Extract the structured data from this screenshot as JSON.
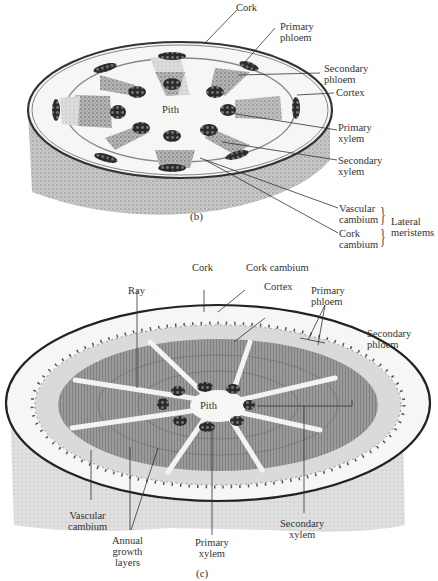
{
  "panel_b": {
    "label": "(b)",
    "labels": {
      "cork": "Cork",
      "primary_phloem": [
        "Primary",
        "phloem"
      ],
      "secondary_phloem": [
        "Secondary",
        "phloem"
      ],
      "cortex": "Cortex",
      "pith": "Pith",
      "primary_xylem": [
        "Primary",
        "xylem"
      ],
      "secondary_xylem": [
        "Secondary",
        "xylem"
      ],
      "vascular_cambium": [
        "Vascular",
        "cambium"
      ],
      "cork_cambium": [
        "Cork",
        "cambium"
      ],
      "lateral_meristems": [
        "Lateral",
        "meristems"
      ]
    }
  },
  "panel_c": {
    "label": "(c)",
    "labels": {
      "cork": "Cork",
      "cork_cambium": "Cork cambium",
      "cortex": "Cortex",
      "ray": "Ray",
      "primary_phloem": [
        "Primary",
        "phloem"
      ],
      "secondary_phloem": [
        "Secondary",
        "phloem"
      ],
      "pith": "Pith",
      "vascular_cambium": [
        "Vascular",
        "cambium"
      ],
      "annual_growth_layers": [
        "Annual",
        "growth",
        "layers"
      ],
      "primary_xylem": [
        "Primary",
        "xylem"
      ],
      "secondary_xylem": [
        "Secondary",
        "xylem"
      ]
    }
  },
  "colors": {
    "bark": "#9a9a9a",
    "cortex": "#f4f4f2",
    "phloem": "#d6d6d6",
    "xylem": "#8e8e8e",
    "bundle": "#2e2e2e",
    "line": "#333333"
  }
}
